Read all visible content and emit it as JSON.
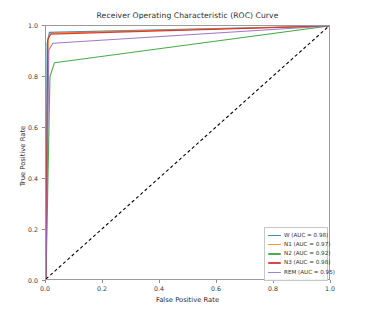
{
  "chart_data": {
    "type": "line",
    "title": "Receiver Operating Characteristic (ROC) Curve",
    "xlabel": "False Positive Rate",
    "ylabel": "True Positive Rate",
    "xlim": [
      0.0,
      1.0
    ],
    "ylim": [
      0.0,
      1.0
    ],
    "xticks": [
      "0.0",
      "0.2",
      "0.4",
      "0.6",
      "0.8",
      "1.0"
    ],
    "xtick_values": [
      0.0,
      0.2,
      0.4,
      0.6,
      0.8,
      1.0
    ],
    "yticks": [
      "0.0",
      "0.2",
      "0.4",
      "0.6",
      "0.8",
      "1.0"
    ],
    "ytick_values": [
      0.0,
      0.2,
      0.4,
      0.6,
      0.8,
      1.0
    ],
    "grid": false,
    "legend_position": "lower right",
    "series": [
      {
        "name": "W",
        "auc": 0.98,
        "legend_label": "W (AUC = 0.98)",
        "color": "#1f77b4",
        "x": [
          0.0,
          0.004,
          0.012,
          1.0
        ],
        "y": [
          0.0,
          0.93,
          0.975,
          1.0
        ]
      },
      {
        "name": "N1",
        "auc": 0.97,
        "legend_label": "N1 (AUC = 0.97)",
        "color": "#ff7f0e",
        "x": [
          0.0,
          0.008,
          0.02,
          1.0
        ],
        "y": [
          0.0,
          0.955,
          0.972,
          1.0
        ]
      },
      {
        "name": "N2",
        "auc": 0.92,
        "legend_label": "N2 (AUC = 0.92)",
        "color": "#2ca02c",
        "x": [
          0.0,
          0.014,
          0.03,
          1.0
        ],
        "y": [
          0.0,
          0.8,
          0.855,
          1.0
        ]
      },
      {
        "name": "N3",
        "auc": 0.98,
        "legend_label": "N3 (AUC = 0.98)",
        "color": "#d62728",
        "x": [
          0.0,
          0.006,
          0.016,
          1.0
        ],
        "y": [
          0.0,
          0.945,
          0.968,
          1.0
        ]
      },
      {
        "name": "REM",
        "auc": 0.95,
        "legend_label": "REM (AUC = 0.95)",
        "color": "#9467bd",
        "x": [
          0.0,
          0.01,
          0.024,
          1.0
        ],
        "y": [
          0.0,
          0.905,
          0.932,
          1.0
        ]
      }
    ],
    "chance_line": {
      "name": "chance-diagonal",
      "color": "#000000",
      "style": "dashed",
      "x": [
        0.0,
        1.0
      ],
      "y": [
        0.0,
        1.0
      ]
    }
  }
}
